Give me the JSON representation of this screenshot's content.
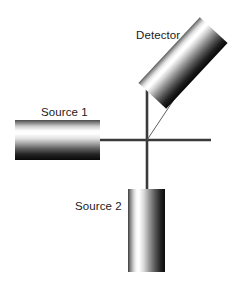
{
  "figure": {
    "width": 241,
    "height": 284,
    "background_color": "#ffffff"
  },
  "labels": {
    "detector": "Detector",
    "source_1": "Source 1",
    "source_2": "Source 2"
  },
  "colors": {
    "background": "#ffffff",
    "line": "#3a3a3a",
    "ray": "#5a5a5a",
    "cylinder_dark": "#0a0a0a",
    "cylinder_mid": "#8a8a8a",
    "cylinder_light": "#ffffff",
    "text": "#1a1a1a"
  },
  "components": [
    {
      "name": "source-1-cylinder",
      "label": "Source 1",
      "orientation": "horizontal",
      "x": 15,
      "y": 120,
      "width": 85,
      "height": 40,
      "gradient": "vertical dark-light-dark"
    },
    {
      "name": "source-2-cylinder",
      "label": "Source 2",
      "orientation": "vertical",
      "x": 128,
      "y": 189,
      "width": 37,
      "height": 83,
      "gradient": "horizontal dark-light-dark"
    },
    {
      "name": "detector-cylinder",
      "label": "Detector",
      "orientation": "tilted",
      "rotation_deg": -43,
      "x": 164,
      "y": 18,
      "width": 38,
      "height": 90,
      "gradient": "across-width light-dark"
    }
  ],
  "axes": {
    "center_x": 147,
    "center_y": 140,
    "vertical_top": 83,
    "vertical_bottom": 189,
    "horizontal_left": 98,
    "horizontal_right": 211,
    "line_thickness": 2.6
  },
  "ray": {
    "name": "scattered-ray",
    "from_x": 147,
    "from_y": 140,
    "to_x": 178,
    "to_y": 93,
    "thickness": 1
  }
}
